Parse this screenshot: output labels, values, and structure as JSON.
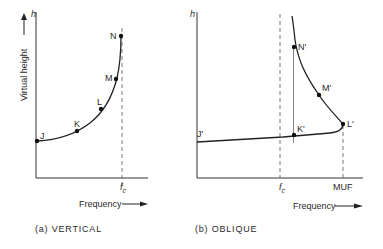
{
  "panels": [
    {
      "id": "a",
      "caption": "(a)   VERTICAL",
      "y_axis_label": "Virtual height",
      "y_axis_symbol": "h",
      "x_axis_label": "Frequency",
      "x_markers": [
        {
          "label": "f",
          "sub": "c"
        }
      ],
      "points": [
        "J",
        "K",
        "L",
        "M",
        "N"
      ]
    },
    {
      "id": "b",
      "caption": "(b)   OBLIQUE",
      "y_axis_label": "Virtual height",
      "y_axis_symbol": "h",
      "x_axis_label": "Frequency",
      "x_markers": [
        {
          "label": "f",
          "sub": "c"
        },
        {
          "label": "MUF"
        }
      ],
      "points": [
        "J'",
        "K'",
        "L'",
        "M'",
        "N'"
      ]
    }
  ]
}
